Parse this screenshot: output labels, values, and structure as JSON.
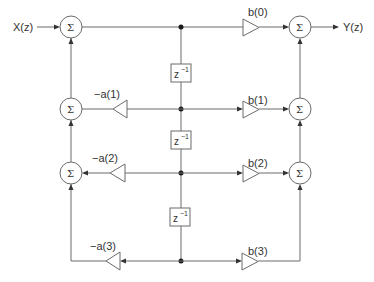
{
  "diagram": {
    "input_label": "X(z)",
    "output_label": "Y(z)",
    "sum_symbol": "Σ",
    "delay": {
      "base": "z",
      "exp": "−1"
    },
    "feedback_gains": [
      {
        "label": "−a(1)"
      },
      {
        "label": "−a(2)"
      },
      {
        "label": "−a(3)"
      }
    ],
    "feedforward_gains": [
      {
        "label": "b(0)"
      },
      {
        "label": "b(1)"
      },
      {
        "label": "b(2)"
      },
      {
        "label": "b(3)"
      }
    ],
    "colors": {
      "line": "#6a6a6a",
      "node": "#1a1a1a",
      "text": "#333333"
    }
  }
}
